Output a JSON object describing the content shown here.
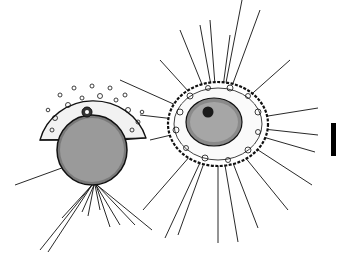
{
  "figure": {
    "background": "#ffffff",
    "ink_color": "#111111",
    "specimens": [
      {
        "name": "left-specimen",
        "view": "lateral",
        "shape": "half-dome shell with spherical central capsule",
        "center": [
          92,
          150
        ],
        "shell_radius": 52,
        "capsule_radius": 35
      },
      {
        "name": "right-specimen",
        "view": "polar",
        "shape": "oval shell ringed with granules, dark nucleus",
        "center": [
          218,
          124
        ],
        "shell_rx": 50,
        "shell_ry": 42
      }
    ],
    "scale_bar": {
      "x": 331,
      "y_top": 123,
      "y_bottom": 156,
      "width": 5,
      "label": ""
    }
  }
}
